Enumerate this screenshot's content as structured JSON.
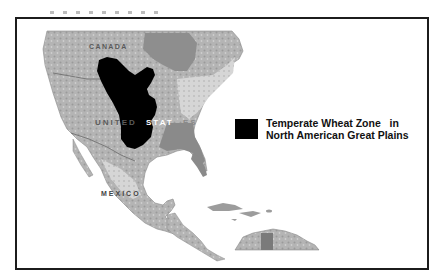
{
  "map": {
    "labels": {
      "canada": "CANADA",
      "united_states_part1": "UNITED",
      "united_states_part2": "STAT",
      "united_states_part3": "ES",
      "mexico": "MEXICO"
    },
    "highlighted_region": {
      "name": "Temperate Wheat Zone",
      "fill_color": "#000000"
    },
    "colors": {
      "land": "#a9a9a9",
      "land_light": "#d4d4d4",
      "land_dark": "#7d7d7d",
      "water": "#ffffff",
      "frame_border": "#1c1c1c"
    }
  },
  "legend": {
    "line1": "Temperate Wheat Zone   in",
    "line2": "North American Great Plains",
    "swatch_color": "#000000"
  }
}
